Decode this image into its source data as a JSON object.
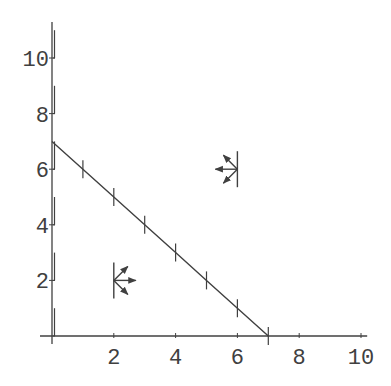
{
  "chart_data": {
    "type": "line",
    "title": "",
    "xlabel": "",
    "ylabel": "",
    "xlim": [
      0,
      10
    ],
    "ylim": [
      0,
      11
    ],
    "grid": false,
    "legend": null,
    "x_ticks": [
      2,
      4,
      6,
      8,
      10
    ],
    "y_ticks": [
      2,
      4,
      6,
      8,
      10
    ],
    "x_tick_labels": [
      "2",
      "4",
      "6",
      "8",
      "10"
    ],
    "y_tick_labels": [
      "2",
      "4",
      "6",
      "8",
      "10"
    ],
    "series": [
      {
        "name": "boundary line x + y = 7",
        "x": [
          0,
          1,
          2,
          3,
          4,
          5,
          6,
          7
        ],
        "y": [
          7,
          6,
          5,
          4,
          3,
          2,
          1,
          0
        ],
        "markers": "perpendicular ticks at integer points"
      }
    ],
    "y_axis_segments": [
      {
        "from": 10,
        "to": 11
      },
      {
        "from": 8,
        "to": 9
      },
      {
        "from": 6,
        "to": 7
      },
      {
        "from": 4,
        "to": 5
      },
      {
        "from": 2,
        "to": 3
      },
      {
        "from": 0,
        "to": 1
      }
    ],
    "annotations": [
      {
        "type": "direction-glyph",
        "x": 2,
        "y": 2,
        "direction": "right",
        "arrows": [
          "up-right",
          "right",
          "down-right"
        ]
      },
      {
        "type": "direction-glyph",
        "x": 6,
        "y": 6,
        "direction": "left",
        "arrows": [
          "up-left",
          "left",
          "down-left"
        ]
      }
    ],
    "line_color": "#404040"
  }
}
